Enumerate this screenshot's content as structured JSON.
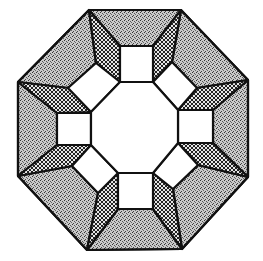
{
  "figure": {
    "colors": {
      "background": "#ffffff",
      "line": "#111111",
      "stipple": "#8a8a8a",
      "crosshatch": "#5a5a5a",
      "window": "#ffffff"
    },
    "outer_octagon": [
      [
        89,
        10
      ],
      [
        181,
        10
      ],
      [
        248,
        80
      ],
      [
        248,
        177
      ],
      [
        182,
        249
      ],
      [
        87,
        250
      ],
      [
        18,
        176
      ],
      [
        18,
        82
      ]
    ],
    "inner_octagon": [
      [
        120,
        82
      ],
      [
        153,
        82
      ],
      [
        178,
        110
      ],
      [
        178,
        143
      ],
      [
        153,
        173
      ],
      [
        118,
        173
      ],
      [
        91,
        145
      ],
      [
        91,
        112
      ]
    ],
    "squares": [
      {
        "name": "top",
        "points": [
          [
            120,
            46
          ],
          [
            153,
            46
          ],
          [
            153,
            82
          ],
          [
            120,
            82
          ]
        ]
      },
      {
        "name": "right",
        "points": [
          [
            178,
            110
          ],
          [
            213,
            110
          ],
          [
            213,
            143
          ],
          [
            178,
            143
          ]
        ]
      },
      {
        "name": "bottom",
        "points": [
          [
            118,
            173
          ],
          [
            153,
            173
          ],
          [
            153,
            209
          ],
          [
            118,
            209
          ]
        ]
      },
      {
        "name": "left",
        "points": [
          [
            57,
            113
          ],
          [
            91,
            113
          ],
          [
            91,
            145
          ],
          [
            57,
            145
          ]
        ]
      }
    ],
    "diamonds": [
      {
        "name": "top-right",
        "points": [
          [
            153,
            82
          ],
          [
            172,
            62
          ],
          [
            197,
            88
          ],
          [
            178,
            110
          ]
        ]
      },
      {
        "name": "bottom-right",
        "points": [
          [
            178,
            143
          ],
          [
            198,
            165
          ],
          [
            173,
            189
          ],
          [
            153,
            173
          ]
        ]
      },
      {
        "name": "bottom-left",
        "points": [
          [
            118,
            173
          ],
          [
            98,
            193
          ],
          [
            72,
            166
          ],
          [
            91,
            145
          ]
        ]
      },
      {
        "name": "top-left",
        "points": [
          [
            91,
            112
          ],
          [
            68,
            88
          ],
          [
            96,
            63
          ],
          [
            120,
            82
          ]
        ]
      }
    ]
  }
}
